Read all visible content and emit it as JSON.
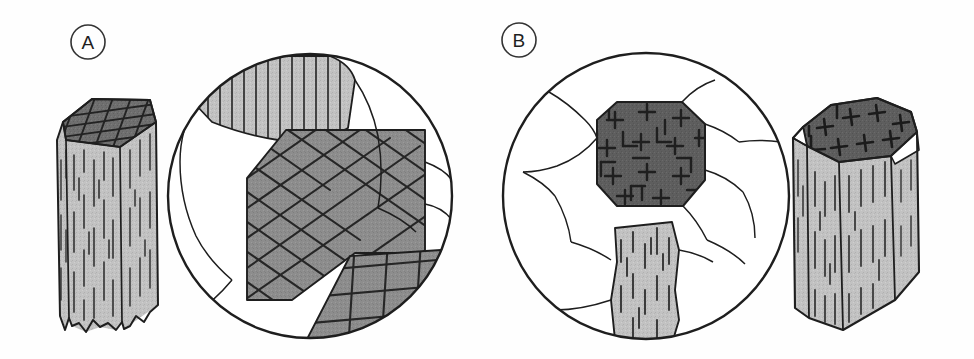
{
  "figure": {
    "width": 974,
    "height": 359,
    "background": "#fefefe"
  },
  "palette": {
    "ink": "#2a2a2a",
    "outline": "#1e1e1e",
    "light_gray": "#c2c2c2",
    "mid_gray": "#8d8d8d",
    "dark_gray": "#6f6f6f",
    "darkest_gray": "#5e5e5e",
    "white": "#ffffff",
    "cleavage_line": "#2d2d2d"
  },
  "panels": [
    {
      "id": "a",
      "label": "A",
      "label_position": {
        "cx": 88,
        "cy": 42,
        "r": 17
      },
      "mineral": "amphibole",
      "crystal": {
        "name": "amphibole-crystal",
        "habit": "elongate prism",
        "top_face_fill": "#6f6f6f",
        "side_face_fill": "#c2c2c2",
        "base": "ragged broken termination",
        "cleavage_on_top": "diamond crosshatch",
        "cleavage_on_sides": "vertical dashes"
      },
      "thin_section": {
        "name": "thin-section-circle-a",
        "center": {
          "cx": 310,
          "cy": 196
        },
        "radius": 143,
        "grain_count": 9,
        "grains": [
          {
            "name": "longitudinal-grain-top",
            "fill": "#c2c2c2",
            "pattern": "vertical-lines"
          },
          {
            "name": "basal-grain-center",
            "fill": "#8d8d8d",
            "pattern": "diamond-crosshatch"
          },
          {
            "name": "basal-grain-lower-right",
            "fill": "#8d8d8d",
            "pattern": "orthogonal-grid"
          },
          {
            "name": "matrix-grain",
            "fill": "#ffffff",
            "pattern": "none"
          }
        ]
      }
    },
    {
      "id": "b",
      "label": "B",
      "label_position": {
        "cx": 519,
        "cy": 40,
        "r": 17
      },
      "mineral": "pyroxene",
      "crystal": {
        "name": "pyroxene-crystal",
        "habit": "stubby prism",
        "top_face_fill": "#5e5e5e",
        "side_face_fill": "#c2c2c2",
        "base": "flat termination",
        "cleavage_on_top": "right-angle plus marks",
        "cleavage_on_sides": "vertical dashes"
      },
      "thin_section": {
        "name": "thin-section-circle-b",
        "center": {
          "cx": 646,
          "cy": 196
        },
        "radius": 144,
        "grain_count": 10,
        "grains": [
          {
            "name": "basal-grain-center",
            "fill": "#5e5e5e",
            "pattern": "right-angle-plus-marks"
          },
          {
            "name": "longitudinal-grain-bottom",
            "fill": "#c2c2c2",
            "pattern": "vertical-dashes"
          },
          {
            "name": "matrix-grain",
            "fill": "#ffffff",
            "pattern": "none"
          }
        ]
      }
    }
  ]
}
